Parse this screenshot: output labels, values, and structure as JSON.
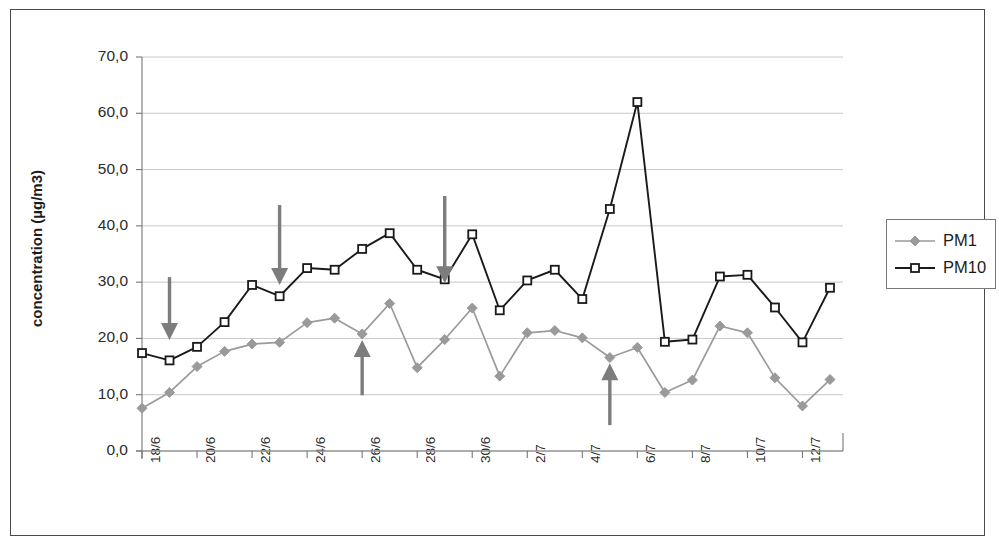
{
  "chart_data": {
    "type": "line",
    "title": "",
    "subtitle": "",
    "xlabel": "",
    "ylabel": "concentration (µg/m3)",
    "ylim": [
      0.0,
      70.0
    ],
    "yticks": [
      0.0,
      10.0,
      20.0,
      30.0,
      40.0,
      50.0,
      60.0,
      70.0
    ],
    "ytick_labels": [
      "0,0",
      "10,0",
      "20,0",
      "30,0",
      "40,0",
      "50,0",
      "60,0",
      "70,0"
    ],
    "grid": true,
    "grid_axis": "y",
    "legend_position": "right",
    "x": [
      "18/6",
      "19/6",
      "20/6",
      "21/6",
      "22/6",
      "23/6",
      "24/6",
      "25/6",
      "26/6",
      "27/6",
      "28/6",
      "29/6",
      "30/6",
      "1/7",
      "2/7",
      "3/7",
      "4/7",
      "5/7",
      "6/7",
      "7/7",
      "8/7",
      "9/7",
      "10/7",
      "11/7",
      "12/7",
      "13/7"
    ],
    "xtick_labels": [
      "18/6",
      "",
      "20/6",
      "",
      "22/6",
      "",
      "24/6",
      "",
      "26/6",
      "",
      "28/6",
      "",
      "30/6",
      "",
      "2/7",
      "",
      "4/7",
      "",
      "6/7",
      "",
      "8/7",
      "",
      "10/7",
      "",
      "12/7",
      ""
    ],
    "xtick_labels_visible": [
      "18/6",
      "20/6",
      "22/6",
      "24/6",
      "26/6",
      "28/6",
      "30/6",
      "2/7",
      "4/7",
      "6/7",
      "8/7",
      "10/7",
      "12/7"
    ],
    "series": [
      {
        "name": "PM1",
        "color": "#9a9a9a",
        "marker": "diamond",
        "marker_filled": true,
        "values": [
          7.6,
          10.4,
          15.0,
          17.7,
          19.0,
          19.3,
          22.8,
          23.6,
          20.8,
          26.2,
          14.8,
          19.8,
          25.4,
          13.3,
          21.0,
          21.4,
          20.1,
          16.6,
          18.4,
          10.4,
          12.6,
          22.2,
          21.0,
          13.0,
          8.0,
          12.7
        ]
      },
      {
        "name": "PM10",
        "color": "#1a1a1a",
        "marker": "square",
        "marker_filled": false,
        "values": [
          17.4,
          16.1,
          18.5,
          22.9,
          29.5,
          27.5,
          32.5,
          32.2,
          35.9,
          38.7,
          32.2,
          30.5,
          38.5,
          25.0,
          30.3,
          32.2,
          27.0,
          43.0,
          62.0,
          19.4,
          19.8,
          31.0,
          31.3,
          25.5,
          19.3,
          29.0
        ]
      }
    ],
    "annotations": [
      {
        "kind": "arrow-down",
        "x_index": 1,
        "x_value": "19/6",
        "color": "#7d7d7d",
        "y_top": 30.9,
        "y_tip": 19.7
      },
      {
        "kind": "arrow-down",
        "x_index": 5,
        "x_value": "23/6",
        "color": "#7d7d7d",
        "y_top": 43.7,
        "y_tip": 29.5
      },
      {
        "kind": "arrow-down",
        "x_index": 11,
        "x_value": "29/6",
        "color": "#7d7d7d",
        "y_top": 45.3,
        "y_tip": 29.8
      },
      {
        "kind": "arrow-up",
        "x_index": 8,
        "x_value": "26/6",
        "color": "#7d7d7d",
        "y_bottom": 9.9,
        "y_tip": 19.7
      },
      {
        "kind": "arrow-up",
        "x_index": 17,
        "x_value": "5/7",
        "color": "#7d7d7d",
        "y_bottom": 4.6,
        "y_tip": 15.6
      }
    ]
  },
  "legend": {
    "entries": [
      {
        "label": "PM1"
      },
      {
        "label": "PM10"
      }
    ]
  },
  "axis": {
    "y_title": "concentration (µg/m3)"
  },
  "colors": {
    "pm1": "#9a9a9a",
    "pm10": "#1a1a1a",
    "arrow": "#7d7d7d",
    "grid": "#c8c8c8",
    "axis": "#777777",
    "frame": "#4a4a4a",
    "background": "#ffffff"
  }
}
